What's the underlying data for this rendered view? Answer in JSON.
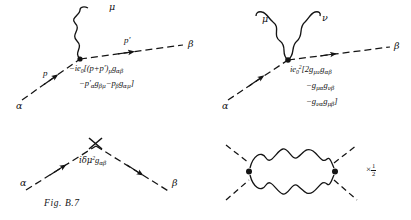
{
  "figure": {
    "caption": "Fig. B.7",
    "background_color": "#ffffff",
    "ink_color": "#141414"
  },
  "diagrams": [
    {
      "id": "scalar-qed-3point-vertex",
      "position": "top-left",
      "legs": [
        {
          "name": "alpha-leg",
          "label": "α",
          "type": "dashed-scalar",
          "direction": "incoming"
        },
        {
          "name": "beta-leg",
          "label": "β",
          "type": "dashed-scalar",
          "direction": "outgoing"
        },
        {
          "name": "photon-leg",
          "label": "μ",
          "type": "wavy-photon"
        }
      ],
      "momenta": [
        {
          "name": "incoming-momentum",
          "label": "p"
        },
        {
          "name": "outgoing-momentum",
          "label": "p′"
        }
      ],
      "amplitude_lines": [
        {
          "prefix": "−ie",
          "sub": "0",
          "rest": "[(p+p′)",
          "mu": "μ",
          "metric": "g",
          "metric_sub": "αβ"
        },
        {
          "text": "−p′",
          "sub1": "α",
          "g1": "g",
          "g1sub": "βμ",
          "text2": "−p",
          "sub2": "β",
          "g2": "g",
          "g2sub": "αμ",
          "close": "]"
        }
      ],
      "amplitude_plain": "−ie₀[(p+p′)μ gαβ − p′α gβμ − pβ gαμ]"
    },
    {
      "id": "scalar-qed-seagull-vertex",
      "position": "top-right",
      "legs": [
        {
          "name": "alpha-leg",
          "label": "α",
          "type": "dashed-scalar",
          "direction": "incoming"
        },
        {
          "name": "beta-leg",
          "label": "β",
          "type": "dashed-scalar",
          "direction": "outgoing"
        },
        {
          "name": "photon-leg-mu",
          "label": "μ",
          "type": "wavy-photon"
        },
        {
          "name": "photon-leg-nu",
          "label": "ν",
          "type": "wavy-photon"
        }
      ],
      "amplitude_plain": "ie₀²[2gμν gαβ − gμα gνβ − gνα gμβ]"
    },
    {
      "id": "mass-counterterm-vertex",
      "position": "bottom-left",
      "legs": [
        {
          "name": "alpha-leg",
          "label": "α",
          "type": "dashed-scalar",
          "direction": "incoming"
        },
        {
          "name": "beta-leg",
          "label": "β",
          "type": "dashed-scalar",
          "direction": "outgoing"
        }
      ],
      "vertex_marker": "cross-x",
      "amplitude_plain": "iδμ² gαβ"
    },
    {
      "id": "two-photon-loop",
      "position": "bottom-right",
      "legs": [
        {
          "name": "external-leg-upper-left",
          "type": "dashed-scalar"
        },
        {
          "name": "external-leg-lower-left",
          "type": "dashed-scalar"
        },
        {
          "name": "external-leg-upper-right",
          "type": "dashed-scalar"
        },
        {
          "name": "external-leg-lower-right",
          "type": "dashed-scalar"
        }
      ],
      "loop": "two-wavy-photon-propagators",
      "symmetry_factor": {
        "times": "×",
        "numerator": "1",
        "denominator": "2"
      }
    }
  ],
  "labels": {
    "alpha": "α",
    "beta": "β",
    "mu": "μ",
    "nu": "ν",
    "p": "p",
    "p_prime": "p′",
    "minus": "−",
    "i": "i",
    "e": "e",
    "zero": "0",
    "two": "2",
    "g": "g",
    "bracket_open": "[",
    "bracket_close": "]",
    "paren_open": "(",
    "paren_close": ")",
    "plus": "+",
    "delta": "δ",
    "times": "×"
  },
  "formula_tl": {
    "l1_a": "−ie",
    "l1_sub": "0",
    "l1_b": "[(p+p′)",
    "l1_mu": "μ",
    "l1_g": "g",
    "l1_gsub": "αβ",
    "l2_a": "−p′",
    "l2_asub": "α",
    "l2_g1": "g",
    "l2_g1sub": "βμ",
    "l2_b": "−p",
    "l2_bsub": "β",
    "l2_g2": "g",
    "l2_g2sub": "αμ",
    "l2_close": "]"
  },
  "formula_tr": {
    "l1_a": "ie",
    "l1_sub": "0",
    "l1_sup": "2",
    "l1_b": "[2g",
    "l1_g1sub": "μν",
    "l1_g2": "g",
    "l1_g2sub": "αβ",
    "l2_a": "−g",
    "l2_g1sub": "μα",
    "l2_g2": "g",
    "l2_g2sub": "νβ",
    "l3_a": "−g",
    "l3_g1sub": "να",
    "l3_g2": "g",
    "l3_g2sub": "μβ",
    "l3_close": "]"
  },
  "formula_bl": {
    "a": "iδμ",
    "sup": "2",
    "g": "g",
    "gsub": "αβ"
  }
}
